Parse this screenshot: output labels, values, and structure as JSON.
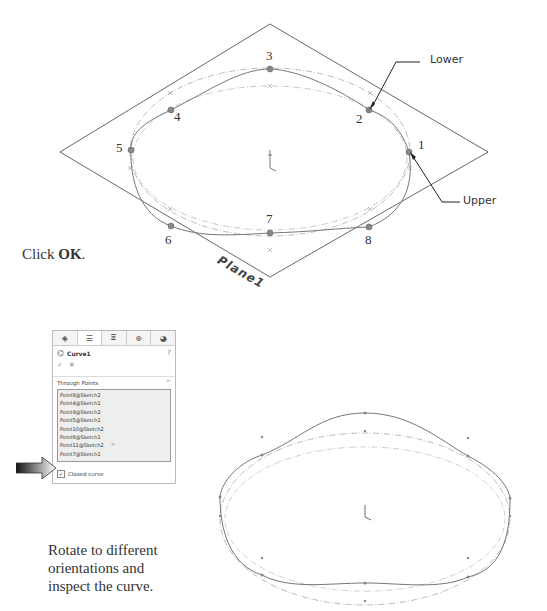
{
  "figure_top": {
    "plane_label": "Plane1",
    "callouts": {
      "lower": "Lower",
      "upper": "Upper"
    },
    "point_labels": [
      {
        "id": "1",
        "label": "1"
      },
      {
        "id": "2",
        "label": "2"
      },
      {
        "id": "3",
        "label": "3"
      },
      {
        "id": "4",
        "label": "4"
      },
      {
        "id": "5",
        "label": "5"
      },
      {
        "id": "6",
        "label": "6"
      },
      {
        "id": "7",
        "label": "7"
      },
      {
        "id": "8",
        "label": "8"
      }
    ]
  },
  "instruction_1": {
    "prefix": "Click ",
    "bold": "OK",
    "suffix": "."
  },
  "property_manager": {
    "tabs": [
      "feature-manager",
      "property-manager",
      "configuration-manager",
      "dimxpert-manager",
      "display-manager"
    ],
    "title": "Curve1",
    "help": "?",
    "ok": "✓",
    "cancel": "✕",
    "section_title": "Through Points",
    "points": [
      "Point8@Sketch2",
      "Point4@Sketch1",
      "Point9@Sketch2",
      "Point5@Sketch1",
      "Point10@Sketch2",
      "Point6@Sketch1",
      "Point11@Sketch2",
      "Point7@Sketch1"
    ],
    "closed_curve_label": "Closed curve",
    "closed_curve_checked": true
  },
  "instruction_2": {
    "lines": [
      "Rotate to different",
      "orientations and",
      "inspect the curve."
    ]
  }
}
